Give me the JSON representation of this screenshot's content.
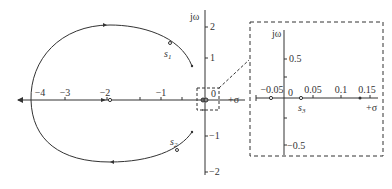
{
  "main_plot": {
    "y_axis_label": "jω",
    "x_axis_label": "+σ",
    "x_ticks": [
      {
        "label": "−4",
        "x": 40
      },
      {
        "label": "−3",
        "x": 65
      },
      {
        "label": "−2",
        "x": 107
      },
      {
        "label": "−1",
        "x": 161
      }
    ],
    "y_ticks": [
      {
        "label": "2",
        "y": 27
      },
      {
        "label": "1",
        "y": 58
      },
      {
        "label": "−1",
        "y": 136
      },
      {
        "label": "−2",
        "y": 172
      }
    ],
    "origin_label": "0",
    "points": {
      "s1": "s₁",
      "s2": "s₂"
    },
    "s1_label": "s",
    "s1_sub": "1",
    "s2_label": "s",
    "s2_sub": "2"
  },
  "inset": {
    "y_axis_label": "jω",
    "x_axis_label": "+σ",
    "x_ticks": [
      {
        "label": "−0.05",
        "x": 262
      },
      {
        "label": "0.05",
        "x": 313
      },
      {
        "label": "0.1",
        "x": 341
      },
      {
        "label": "0.15",
        "x": 370
      }
    ],
    "y_ticks": [
      {
        "label": "0.5",
        "y": 59
      },
      {
        "label": "−0.5",
        "y": 145
      }
    ],
    "origin_label": "0",
    "s3_label": "s",
    "s3_sub": "3"
  }
}
